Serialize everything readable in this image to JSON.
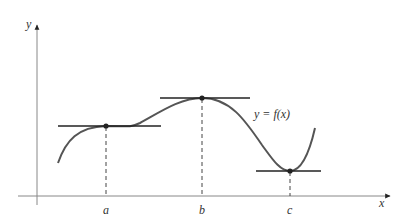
{
  "diagram": {
    "axes": {
      "x_label": "x",
      "y_label": "y"
    },
    "function_label": "y = f(x)",
    "points": [
      {
        "label": "a",
        "type": "horizontal tangent (inflection)"
      },
      {
        "label": "b",
        "type": "local maximum"
      },
      {
        "label": "c",
        "type": "local minimum"
      }
    ],
    "colors": {
      "curve": "#555555",
      "tangent": "#222222",
      "axis": "#888888",
      "dashed": "#444444"
    }
  }
}
